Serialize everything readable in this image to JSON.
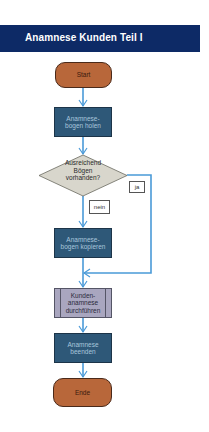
{
  "header": {
    "title": "Anamnese Kunden Teil I"
  },
  "colors": {
    "header_bg": "#0d2a66",
    "terminal": "#b8673a",
    "process": "#2e5878",
    "predefined": "#a9a6bf",
    "decision": "#d8d6cc",
    "connector": "#4a9ad8"
  },
  "flowchart": {
    "nodes": [
      {
        "id": "start",
        "type": "terminal",
        "label": "Start"
      },
      {
        "id": "get-forms",
        "type": "process",
        "label": "Anamnese-\nbogen holen"
      },
      {
        "id": "enough-forms",
        "type": "decision",
        "label": "Ausreichend\nBögen\nvorhanden?"
      },
      {
        "id": "copy-forms",
        "type": "process",
        "label": "Anamnese-\nbogen kopieren"
      },
      {
        "id": "conduct-anamnesis",
        "type": "predefined-process",
        "label": "Kunden-\nanamnese\ndurchführen"
      },
      {
        "id": "end-anamnesis",
        "type": "process",
        "label": "Anamnese\nbeenden"
      },
      {
        "id": "end",
        "type": "terminal",
        "label": "Ende"
      }
    ],
    "edges": [
      {
        "from": "start",
        "to": "get-forms"
      },
      {
        "from": "get-forms",
        "to": "enough-forms"
      },
      {
        "from": "enough-forms",
        "to": "copy-forms",
        "label": "nein"
      },
      {
        "from": "enough-forms",
        "to": "conduct-anamnesis",
        "label": "ja"
      },
      {
        "from": "copy-forms",
        "to": "conduct-anamnesis"
      },
      {
        "from": "conduct-anamnesis",
        "to": "end-anamnesis"
      },
      {
        "from": "end-anamnesis",
        "to": "end"
      }
    ],
    "labels": {
      "yes": "ja",
      "no": "nein"
    }
  }
}
